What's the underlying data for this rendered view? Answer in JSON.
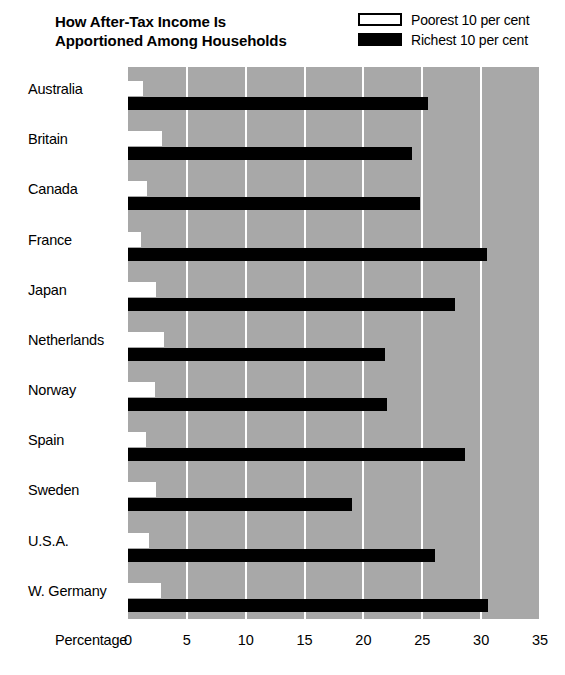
{
  "title": {
    "line1": "How After-Tax Income Is",
    "line2": "Apportioned Among Households"
  },
  "legend": {
    "items": [
      {
        "label": "Poorest 10 per cent",
        "swatch": "white-outlined-rect",
        "color": "#ffffff"
      },
      {
        "label": "Richest 10 per cent",
        "swatch": "black-filled-rect",
        "color": "#000000"
      }
    ]
  },
  "axis": {
    "title": "Percentage",
    "ticks": [
      "0",
      "5",
      "10",
      "15",
      "20",
      "25",
      "30",
      "35"
    ]
  },
  "colors": {
    "plot_background": "#a8a8a8",
    "gridline": "#ffffff",
    "poorest_bar": "#ffffff",
    "richest_bar": "#000000",
    "page_background": "#ffffff",
    "text": "#000000"
  },
  "chart_data": {
    "type": "bar",
    "orientation": "horizontal",
    "title": "How After-Tax Income Is Apportioned Among Households",
    "xlabel": "Percentage",
    "ylabel": "",
    "xlim": [
      0,
      35
    ],
    "xticks": [
      0,
      5,
      10,
      15,
      20,
      25,
      30,
      35
    ],
    "grid": true,
    "grid_axis": "x",
    "legend_position": "top-right",
    "categories": [
      "Australia",
      "Britain",
      "Canada",
      "France",
      "Japan",
      "Netherlands",
      "Norway",
      "Spain",
      "Sweden",
      "U.S.A.",
      "W. Germany"
    ],
    "series": [
      {
        "name": "Poorest 10 per cent",
        "values": [
          1.3,
          2.9,
          1.6,
          1.1,
          2.4,
          3.1,
          2.3,
          1.5,
          2.4,
          1.8,
          2.8
        ]
      },
      {
        "name": "Richest 10 per cent",
        "values": [
          25.5,
          24.1,
          24.8,
          30.5,
          27.8,
          21.8,
          22.0,
          28.6,
          19.0,
          26.1,
          30.6
        ]
      }
    ]
  }
}
